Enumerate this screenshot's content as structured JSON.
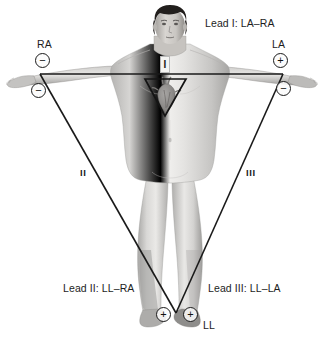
{
  "figure": {
    "title_lead1": "Lead I: LA–RA",
    "title_lead2": "Lead II: LL–RA",
    "title_lead3": "Lead III: LL–LA",
    "caption": "",
    "background_color": "#ffffff",
    "line_color": "#1a1a1a",
    "text_color": "#1d1d1d"
  },
  "electrode_sites": {
    "right_arm_label": "RA",
    "left_arm_label": "LA",
    "left_leg_label": "LL"
  },
  "electrodes": [
    {
      "name": "ra-lead1-negative",
      "polarity": "−",
      "x": 35,
      "y": 53
    },
    {
      "name": "ra-lead2-negative",
      "polarity": "−",
      "x": 31,
      "y": 83
    },
    {
      "name": "la-lead1-positive",
      "polarity": "+",
      "x": 273,
      "y": 53
    },
    {
      "name": "la-lead3-negative",
      "polarity": "−",
      "x": 276,
      "y": 81
    },
    {
      "name": "ll-lead2-positive",
      "polarity": "+",
      "x": 156,
      "y": 307
    },
    {
      "name": "ll-lead3-positive",
      "polarity": "+",
      "x": 183,
      "y": 307
    }
  ],
  "lead_vectors": {
    "roman_lead2": "II",
    "roman_lead3": "III",
    "chest_marker": "I"
  },
  "triangle": {
    "vertex_right_arm": [
      40,
      74
    ],
    "vertex_left_arm": [
      283,
      74
    ],
    "vertex_left_leg": [
      176,
      313
    ]
  },
  "heart_triangle": {
    "top_left": [
      145,
      79
    ],
    "top_right": [
      186,
      79
    ],
    "apex": [
      165,
      116
    ]
  },
  "colors": {
    "skin_light": "#e3e2e0",
    "skin_mid": "#c9c8c6",
    "skin_shadow": "#9e9d9b",
    "hair": "#221f1d",
    "heart": "#8d8b89"
  }
}
